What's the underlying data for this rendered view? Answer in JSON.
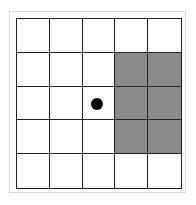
{
  "diagram": {
    "type": "grid",
    "rows": 5,
    "cols": 5,
    "cell_colors": {
      "empty": "#ffffff",
      "shaded": "#8a8a8a",
      "line": "#222222"
    },
    "shaded_cells": [
      {
        "row": 2,
        "col": 4
      },
      {
        "row": 2,
        "col": 5
      },
      {
        "row": 3,
        "col": 4
      },
      {
        "row": 3,
        "col": 5
      },
      {
        "row": 4,
        "col": 4
      },
      {
        "row": 4,
        "col": 5
      }
    ],
    "marker": {
      "shape": "filled-circle",
      "row": 3,
      "col": 3,
      "color": "#000000"
    }
  }
}
